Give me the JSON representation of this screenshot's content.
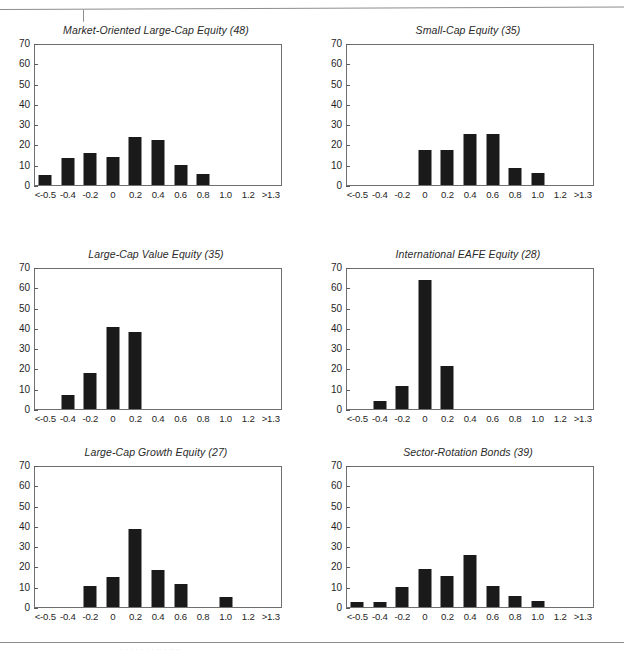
{
  "page": {
    "rule_top": true,
    "rule_bottom": true,
    "caption_bleed": "·  ·   ·    ·   ·    ·      ·   ·· · ····",
    "frame_color": "#6f6f6f",
    "bar_color": "#1a1a1a",
    "rule_color": "#8d8d8d"
  },
  "axes": {
    "x_ticks": [
      "<-0.5",
      "-0.4",
      "-0.2",
      "0",
      "0.2",
      "0.4",
      "0.6",
      "0.8",
      "1.0",
      "1.2",
      ">1.3"
    ],
    "y_ticks": [
      "0",
      "10",
      "20",
      "30",
      "40",
      "50",
      "60",
      "70"
    ],
    "ylim": [
      0,
      70
    ]
  },
  "chart_data": [
    {
      "type": "bar",
      "title": "Market-Oriented Large-Cap Equity (48)",
      "xlabel": "",
      "ylabel": "",
      "ylim": [
        0,
        70
      ],
      "grid": false,
      "legend": "none",
      "categories": [
        "<-0.5",
        "-0.4",
        "-0.2",
        "0",
        "0.2",
        "0.4",
        "0.6",
        "0.8",
        "1.0",
        "1.2",
        ">1.3"
      ],
      "values": [
        5,
        13.5,
        16,
        14,
        24,
        22.5,
        10,
        5.5,
        0,
        0,
        0
      ]
    },
    {
      "type": "bar",
      "title": "Small-Cap Equity (35)",
      "xlabel": "",
      "ylabel": "",
      "ylim": [
        0,
        70
      ],
      "grid": false,
      "legend": "none",
      "categories": [
        "<-0.5",
        "-0.4",
        "-0.2",
        "0",
        "0.2",
        "0.4",
        "0.6",
        "0.8",
        "1.0",
        "1.2",
        ">1.3"
      ],
      "values": [
        0,
        0,
        0,
        17.5,
        17.5,
        25.5,
        25.5,
        8.5,
        6,
        0,
        0
      ]
    },
    {
      "type": "bar",
      "title": "Large-Cap Value Equity (35)",
      "xlabel": "",
      "ylabel": "",
      "ylim": [
        0,
        70
      ],
      "grid": false,
      "legend": "none",
      "categories": [
        "<-0.5",
        "-0.4",
        "-0.2",
        "0",
        "0.2",
        "0.4",
        "0.6",
        "0.8",
        "1.0",
        "1.2",
        ">1.3"
      ],
      "values": [
        0,
        7,
        17.8,
        41,
        38.5,
        0,
        0,
        0,
        0,
        0,
        0
      ]
    },
    {
      "type": "bar",
      "title": "International EAFE Equity (28)",
      "xlabel": "",
      "ylabel": "",
      "ylim": [
        0,
        70
      ],
      "grid": false,
      "legend": "none",
      "categories": [
        "<-0.5",
        "-0.4",
        "-0.2",
        "0",
        "0.2",
        "0.4",
        "0.6",
        "0.8",
        "1.0",
        "1.2",
        ">1.3"
      ],
      "values": [
        0,
        4,
        11.7,
        64.5,
        21.5,
        0,
        0,
        0,
        0,
        0,
        0
      ]
    },
    {
      "type": "bar",
      "title": "Large-Cap Growth Equity (27)",
      "xlabel": "",
      "ylabel": "",
      "ylim": [
        0,
        70
      ],
      "grid": false,
      "legend": "none",
      "categories": [
        "<-0.5",
        "-0.4",
        "-0.2",
        "0",
        "0.2",
        "0.4",
        "0.6",
        "0.8",
        "1.0",
        "1.2",
        ">1.3"
      ],
      "values": [
        0,
        0,
        10.7,
        14.8,
        39,
        18.3,
        11.7,
        0,
        5,
        0,
        0
      ]
    },
    {
      "type": "bar",
      "title": "Sector-Rotation Bonds (39)",
      "xlabel": "",
      "ylabel": "",
      "ylim": [
        0,
        70
      ],
      "grid": false,
      "legend": "none",
      "categories": [
        "<-0.5",
        "-0.4",
        "-0.2",
        "0",
        "0.2",
        "0.4",
        "0.6",
        "0.8",
        "1.0",
        "1.2",
        ">1.3"
      ],
      "values": [
        2.5,
        2.7,
        10,
        19,
        15.7,
        26,
        10.5,
        5.5,
        2.8,
        0,
        0
      ]
    }
  ]
}
